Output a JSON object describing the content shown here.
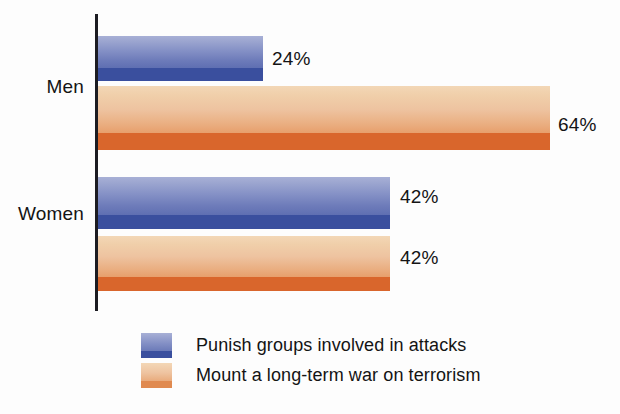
{
  "chart_data": {
    "type": "bar",
    "orientation": "horizontal",
    "grouped": true,
    "title": "",
    "subtitle": "",
    "xlabel": "",
    "ylabel": "",
    "xlim": [
      0,
      100
    ],
    "grid": false,
    "legend_position": "bottom-left",
    "categories": [
      "Men",
      "Women"
    ],
    "series": [
      {
        "name": "Punish groups involved in attacks",
        "color": "#5b6eae",
        "accent_color": "#3a4f9e",
        "values": [
          24,
          42
        ],
        "value_labels": [
          "24%",
          "42%"
        ]
      },
      {
        "name": "Mount a long-term war on terrorism",
        "color": "#e89a62",
        "accent_color": "#d9662c",
        "values": [
          64,
          42
        ],
        "value_labels": [
          "64%",
          "42%"
        ]
      }
    ]
  },
  "axis": {
    "category_labels": {
      "men": "Men",
      "women": "Women"
    },
    "line_color": "#1c1c22"
  },
  "bars": {
    "men_blue": {
      "label": "24%"
    },
    "men_orange": {
      "label": "64%"
    },
    "women_blue": {
      "label": "42%"
    },
    "women_orange": {
      "label": "42%"
    }
  },
  "legend": {
    "items": [
      {
        "label": "Punish groups involved in attacks",
        "swatch": "blue-swatch-icon"
      },
      {
        "label": "Mount a long-term war on terrorism",
        "swatch": "orange-swatch-icon"
      }
    ]
  }
}
